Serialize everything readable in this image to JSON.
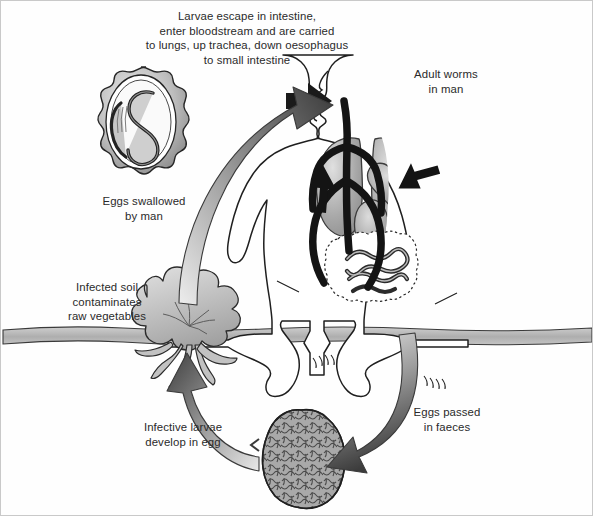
{
  "figure": {
    "background_color": "#fefefe",
    "border_color": "#c9c9c9",
    "ink_color": "#2a2a2a"
  },
  "labels": {
    "migration": "Larvae escape in intestine,\nenter bloodstream and are carried\nto lungs, up trachea, down oesophagus\nto small intestine",
    "adult_worms": "Adult worms\nin man",
    "eggs_swallowed": "Eggs swallowed\nby man",
    "infected_soil": "Infected soil\ncontaminates\nraw vegetables",
    "infective_larvae": "Infective larvae\ndevelop in egg",
    "eggs_passed": "Eggs passed\nin faeces"
  },
  "colors": {
    "arrow_dark": "#3c3c3c",
    "arrow_light": "#e2e2e2",
    "arrow_black": "#141414",
    "organ_gray": "#9a9a9a",
    "organ_light": "#d8d8d8",
    "soil_gray": "#b4b4b4",
    "faeces_gray": "#a8a8a8",
    "outline": "#1c1c1c"
  },
  "elements": {
    "egg_with_larva": "scalloped-oval egg containing coiled S-shaped larva",
    "human_figure": "seated man outline, white, showing trachea, lungs, heart and intestines",
    "lungs": "two gray lobes either side of trachea",
    "heart": "gray heart between lungs",
    "intestines": "dotted-outline abdominal box containing coiled adult worms",
    "vegetable": "leafy vegetable above soil line with roots below",
    "soil_line": "horizontal gray soil band across the page",
    "faeces_mass": "textured gray oval mass of faeces"
  },
  "arrows": {
    "swallow_arrow": "large curved gradient arrow from soil up to mouth (light to dark, head top-right)",
    "mouth_arrow": "solid black arrow entering mouth",
    "lung_arrows": "black arrows inside chest showing larval migration via lungs and heart",
    "faeces_arrow": "curved gradient arrow from man down to faeces (light to dark, head bottom-left)",
    "soil_arrow": "curved gradient arrow from faeces up to vegetable roots (light to dark, head top)"
  }
}
